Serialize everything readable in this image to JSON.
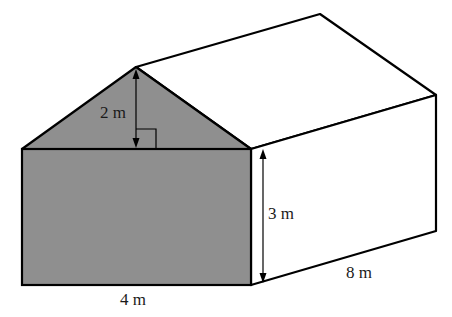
{
  "diagram": {
    "type": "house-shaped prism (pentagonal prism)",
    "colors": {
      "front_face_fill": "#8f8f8f",
      "side_fill": "#ffffff",
      "stroke": "#000000"
    },
    "labels": {
      "roof_height": "2 m",
      "wall_height": "3 m",
      "width": "4 m",
      "length": "8 m"
    }
  }
}
